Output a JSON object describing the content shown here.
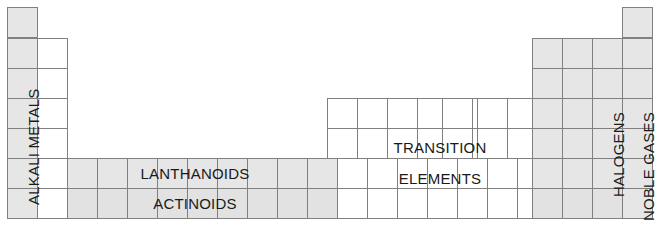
{
  "diagram": {
    "colors": {
      "shade": "#e6e6e6",
      "shade_dark": "#e0e0e0",
      "border": "#808080",
      "text": "#1a1a1a",
      "background": "#ffffff"
    },
    "grid": {
      "cell_width": 30,
      "cell_height": 30,
      "origin_x": 7,
      "origin_y": 7,
      "columns": 21,
      "rows": 7
    },
    "labels": [
      {
        "id": "alkali-metals",
        "text": "ALKALI METALS",
        "orientation": "vertical"
      },
      {
        "id": "lanthanoids",
        "text": "LANTHANOIDS",
        "orientation": "horizontal"
      },
      {
        "id": "actinoids",
        "text": "ACTINOIDS",
        "orientation": "horizontal"
      },
      {
        "id": "transition-elements-line1",
        "text": "TRANSITION",
        "orientation": "horizontal"
      },
      {
        "id": "transition-elements-line2",
        "text": "ELEMENTS",
        "orientation": "horizontal"
      },
      {
        "id": "halogens",
        "text": "HALOGENS",
        "orientation": "vertical"
      },
      {
        "id": "noble-gases",
        "text": "NOBLE GASES",
        "orientation": "vertical"
      }
    ]
  }
}
